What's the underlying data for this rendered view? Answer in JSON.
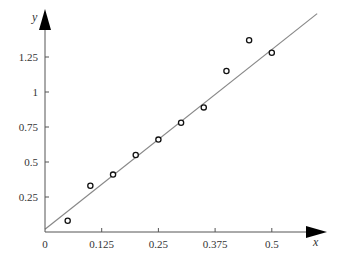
{
  "chart_data": {
    "type": "scatter",
    "title": "",
    "xlabel": "x",
    "ylabel": "y",
    "xlim": [
      0,
      0.6
    ],
    "ylim": [
      0,
      1.5
    ],
    "grid": false,
    "legend": null,
    "x_ticks": [
      {
        "value": 0,
        "label": "0"
      },
      {
        "value": 0.125,
        "label": "0.125"
      },
      {
        "value": 0.25,
        "label": "0.25"
      },
      {
        "value": 0.375,
        "label": "0.375"
      },
      {
        "value": 0.5,
        "label": "0.5"
      }
    ],
    "y_ticks": [
      {
        "value": 0.25,
        "label": "0.25"
      },
      {
        "value": 0.5,
        "label": "0.5"
      },
      {
        "value": 0.75,
        "label": "0.75"
      },
      {
        "value": 1,
        "label": "1"
      },
      {
        "value": 1.25,
        "label": "1.25"
      }
    ],
    "series": [
      {
        "name": "data points",
        "kind": "scatter",
        "marker": "hollow-circle",
        "x": [
          0.05,
          0.1,
          0.15,
          0.2,
          0.25,
          0.3,
          0.35,
          0.4,
          0.45,
          0.5
        ],
        "y": [
          0.08,
          0.33,
          0.41,
          0.55,
          0.66,
          0.78,
          0.89,
          1.15,
          1.37,
          1.28
        ]
      },
      {
        "name": "fit line",
        "kind": "line",
        "color": "#888888",
        "x": [
          0,
          0.6
        ],
        "y": [
          0.02,
          1.56
        ]
      }
    ]
  },
  "labels": {
    "x_axis": "x",
    "y_axis": "y"
  }
}
